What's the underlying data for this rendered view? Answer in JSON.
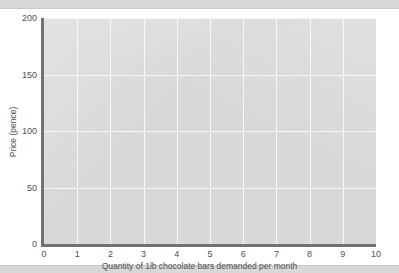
{
  "chart_data": {
    "type": "line",
    "title": "",
    "subtitle": "",
    "xlabel": "Quantity of 1lb chocolate bars demanded per month",
    "ylabel": "Price (pence)",
    "xlim": [
      0,
      10
    ],
    "ylim": [
      0,
      200
    ],
    "xticks": [
      "0",
      "1",
      "2",
      "3",
      "4",
      "5",
      "6",
      "7",
      "8",
      "9",
      "10"
    ],
    "yticks": [
      "0",
      "50",
      "100",
      "150",
      "200"
    ],
    "xtick_values": [
      0,
      1,
      2,
      3,
      4,
      5,
      6,
      7,
      8,
      9,
      10
    ],
    "ytick_values": [
      0,
      50,
      100,
      150,
      200
    ],
    "grid": true,
    "legend": null,
    "series": [],
    "annotations": [],
    "plot_background_color": "#d3d4d5",
    "gridline_color": "#ffffff",
    "axis_color": "#6f7173",
    "text_color": "#4f5153"
  },
  "figure": {
    "x_axis_title": "Quantity of 1lb chocolate bars demanded per month",
    "y_axis_title": "Price (pence)"
  }
}
